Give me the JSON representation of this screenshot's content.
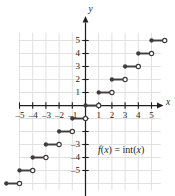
{
  "chart_data": {
    "type": "line",
    "title": "",
    "xlabel": "x",
    "ylabel": "y",
    "annotation": "f(x) = int(x)",
    "annotation_parts": {
      "fn": "f",
      "arg_open": "(",
      "var1": "x",
      "arg_close": ")",
      "equals": " = ",
      "name": "int",
      "var2": "x"
    },
    "grid": true,
    "xlim": [
      -6,
      6
    ],
    "ylim": [
      -6.6,
      6
    ],
    "xticks": [
      -5,
      -4,
      -3,
      -2,
      -1,
      1,
      2,
      3,
      4,
      5
    ],
    "yticks": [
      -5,
      -4,
      -3,
      -2,
      -1,
      1,
      2,
      3,
      4,
      5
    ],
    "xtick_labels": [
      "–5",
      "–4",
      "–3",
      "–2",
      "–1",
      "1",
      "2",
      "3",
      "4",
      "5"
    ],
    "ytick_labels": [
      "–5",
      "–4",
      "–3",
      "–2",
      "–1",
      "1",
      "2",
      "3",
      "4",
      "5"
    ],
    "visible_ytick_labels": [
      "–5",
      "–4",
      "–3",
      "1",
      "2",
      "3",
      "4",
      "5"
    ],
    "series_name": "greatest integer function",
    "steps": [
      {
        "x_start": -6,
        "x_end": -5,
        "y": -6,
        "closed_left": true,
        "open_right": true
      },
      {
        "x_start": -5,
        "x_end": -4,
        "y": -5,
        "closed_left": true,
        "open_right": true
      },
      {
        "x_start": -4,
        "x_end": -3,
        "y": -4,
        "closed_left": true,
        "open_right": true
      },
      {
        "x_start": -3,
        "x_end": -2,
        "y": -3,
        "closed_left": true,
        "open_right": true
      },
      {
        "x_start": -2,
        "x_end": -1,
        "y": -2,
        "closed_left": true,
        "open_right": true
      },
      {
        "x_start": -1,
        "x_end": 0,
        "y": -1,
        "closed_left": true,
        "open_right": true
      },
      {
        "x_start": 0,
        "x_end": 1,
        "y": 0,
        "closed_left": true,
        "open_right": true
      },
      {
        "x_start": 1,
        "x_end": 2,
        "y": 1,
        "closed_left": true,
        "open_right": true
      },
      {
        "x_start": 2,
        "x_end": 3,
        "y": 2,
        "closed_left": true,
        "open_right": true
      },
      {
        "x_start": 3,
        "x_end": 4,
        "y": 3,
        "closed_left": true,
        "open_right": true
      },
      {
        "x_start": 4,
        "x_end": 5,
        "y": 4,
        "closed_left": true,
        "open_right": true
      },
      {
        "x_start": 5,
        "x_end": 6,
        "y": 5,
        "closed_left": true,
        "open_right": true
      }
    ],
    "colors": {
      "curve": "#3f3c3d",
      "axis": "#231f20",
      "grid": "#dededf",
      "background": "#ffffff",
      "open_marker_fill": "#ffffff"
    }
  }
}
